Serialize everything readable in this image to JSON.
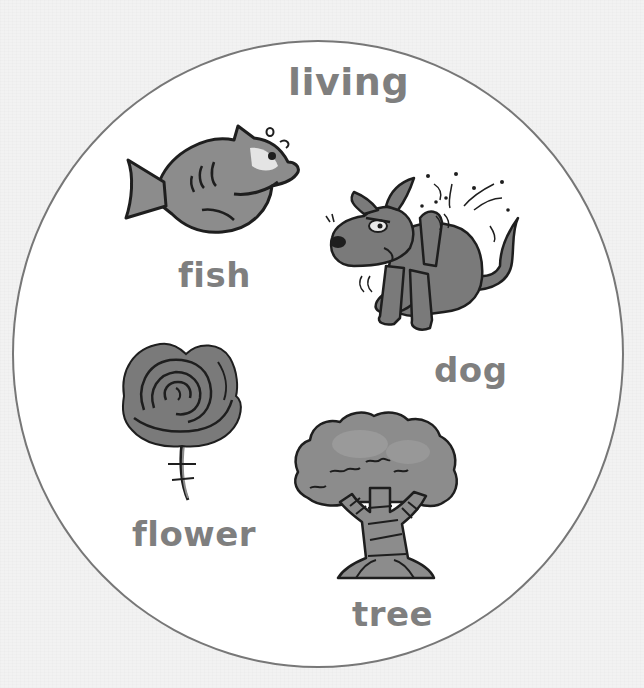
{
  "diagram": {
    "category_title": "living",
    "items": [
      {
        "label": "fish",
        "illustration": "fish-icon"
      },
      {
        "label": "dog",
        "illustration": "dog-icon"
      },
      {
        "label": "flower",
        "illustration": "flower-icon"
      },
      {
        "label": "tree",
        "illustration": "tree-icon"
      }
    ]
  },
  "colors": {
    "background": "#f2f2f2",
    "circle_fill": "#ffffff",
    "circle_stroke": "#777777",
    "label_text": "#7f7f7f",
    "illustration_fill": "#8c8c8c",
    "illustration_outline": "#1e1e1e"
  }
}
